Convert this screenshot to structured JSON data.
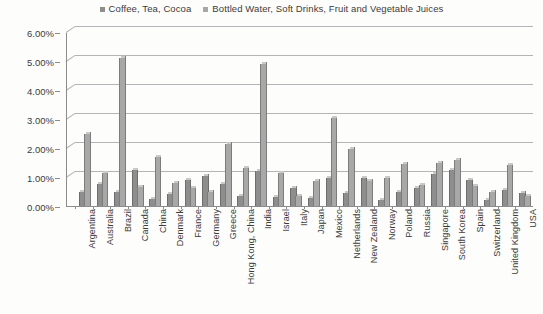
{
  "chart_data": {
    "type": "bar",
    "title": "",
    "subtitle": "",
    "xlabel": "",
    "ylabel": "",
    "ylim": [
      0,
      6
    ],
    "ytick_labels": [
      "0.00%",
      "1.00%",
      "2.00%",
      "3.00%",
      "4.00%",
      "5.00%",
      "6.00%"
    ],
    "ytick_values": [
      0,
      1,
      2,
      3,
      4,
      5,
      6
    ],
    "grid": true,
    "legend_position": "top-center",
    "value_unit": "%",
    "categories": [
      "Argentina",
      "Australia",
      "Brazil",
      "Canada",
      "China",
      "Denmark",
      "France",
      "Germany",
      "Greece",
      "Hong Kong, China",
      "India",
      "Israel",
      "Italy",
      "Japan",
      "Mexico",
      "Netherlands",
      "New Zealand",
      "Norway",
      "Poland",
      "Russia",
      "Singapore",
      "South Korea",
      "Spain",
      "Switzerland",
      "United Kingdom",
      "USA"
    ],
    "series": [
      {
        "name": "Coffee, Tea, Cocoa",
        "color": "#8e8e8e",
        "values": [
          0.5,
          0.75,
          0.5,
          1.25,
          0.25,
          0.42,
          0.9,
          1.05,
          0.75,
          0.35,
          1.2,
          0.3,
          0.62,
          0.28,
          0.95,
          0.45,
          0.95,
          0.2,
          0.5,
          0.62,
          1.1,
          1.25,
          0.88,
          0.2,
          0.55,
          0.45
        ]
      },
      {
        "name": "Bottled Water, Soft Drinks, Fruit and Vegetable Juices",
        "color": "#a8a8a8",
        "values": [
          2.5,
          1.15,
          5.1,
          0.65,
          1.7,
          0.78,
          0.62,
          0.5,
          2.15,
          1.3,
          4.88,
          1.15,
          0.35,
          0.85,
          3.05,
          1.95,
          0.85,
          0.95,
          1.45,
          0.72,
          1.5,
          1.6,
          0.7,
          0.5,
          1.42,
          0.35
        ]
      }
    ]
  },
  "legend": {
    "items": [
      {
        "label": "Coffee, Tea, Cocoa"
      },
      {
        "label": "Bottled Water, Soft Drinks, Fruit and Vegetable Juices"
      }
    ]
  }
}
